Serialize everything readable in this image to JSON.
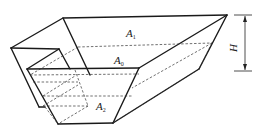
{
  "figure": {
    "labels": {
      "top_area": {
        "main": "A",
        "sub": "1"
      },
      "mid_area": {
        "main": "A",
        "sub": "0"
      },
      "bottom_area": {
        "main": "A",
        "sub": "2"
      },
      "height": "H"
    },
    "colors": {
      "line": "#1a1a1a",
      "background": "#ffffff"
    }
  }
}
